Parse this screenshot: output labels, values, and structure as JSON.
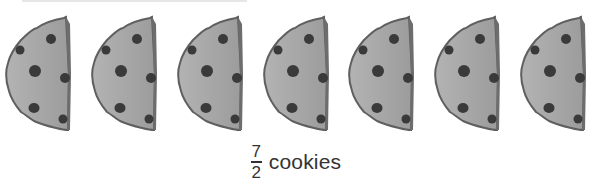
{
  "figure": {
    "cookie_count": 7,
    "cookie_icon": "half-chocolate-chip-cookie-icon",
    "colors": {
      "cookie_fill": "#a9a9a9",
      "cookie_edge": "#5f5f5f",
      "chip": "#3a3a3a",
      "text": "#333333"
    }
  },
  "caption": {
    "numerator": "7",
    "denominator": "2",
    "unit": "cookies"
  }
}
